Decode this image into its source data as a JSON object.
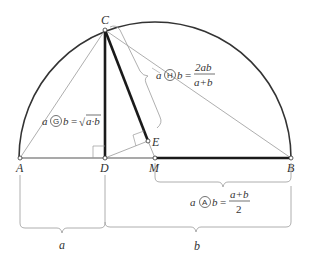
{
  "diagram": {
    "points": {
      "A": "A",
      "B": "B",
      "C": "C",
      "D": "D",
      "E": "E",
      "M": "M"
    },
    "segments": {
      "a_label": "a",
      "b_label": "b"
    },
    "formulas": {
      "geometric": {
        "lhs_a": "a",
        "symbol": "G",
        "lhs_b": "b",
        "eq": "=",
        "radical": "√",
        "radicand": "a·b"
      },
      "harmonic": {
        "lhs_a": "a",
        "symbol": "H",
        "lhs_b": "b",
        "eq": "=",
        "numerator": "2ab",
        "denominator": "a+b"
      },
      "arithmetic": {
        "lhs_a": "a",
        "symbol": "A",
        "lhs_b": "b",
        "eq": "=",
        "numerator": "a+b",
        "denominator": "2"
      }
    },
    "colors": {
      "thick_line": "#1a1a1a",
      "thin_line": "#8a8a8a",
      "brace": "#9a9a9a",
      "text": "#333333"
    }
  }
}
